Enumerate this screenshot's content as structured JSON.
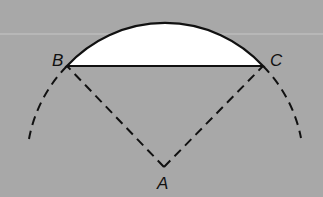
{
  "diagram": {
    "type": "geometry-construction",
    "colors": {
      "background": "#a8a8a8",
      "segment_fill": "#ffffff",
      "stroke": "#111111",
      "scan_line": "#c8c8c8"
    },
    "points": [
      {
        "id": "B",
        "label": "B",
        "x": 67,
        "y": 66
      },
      {
        "id": "C",
        "label": "C",
        "x": 263,
        "y": 66
      },
      {
        "id": "A",
        "label": "A",
        "x": 164,
        "y": 167
      }
    ],
    "labels": {
      "B": "B",
      "C": "C",
      "A": "A"
    },
    "elements": [
      {
        "kind": "arc",
        "style": "solid",
        "from": "B",
        "to": "C",
        "note": "upper arc of segment"
      },
      {
        "kind": "segment",
        "style": "solid",
        "from": "B",
        "to": "C",
        "note": "chord"
      },
      {
        "kind": "segment",
        "style": "dashed",
        "from": "A",
        "to": "B"
      },
      {
        "kind": "segment",
        "style": "dashed",
        "from": "A",
        "to": "C"
      },
      {
        "kind": "arc",
        "style": "dashed",
        "center": "A",
        "note": "left extension below B"
      },
      {
        "kind": "arc",
        "style": "dashed",
        "center": "A",
        "note": "right extension below C"
      }
    ]
  }
}
